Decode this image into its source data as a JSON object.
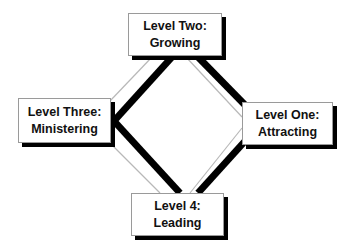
{
  "diagram": {
    "type": "cycle-diamond",
    "nodes": [
      {
        "id": "top",
        "line1": "Level Two:",
        "line2": "Growing"
      },
      {
        "id": "left",
        "line1": "Level Three:",
        "line2": "Ministering"
      },
      {
        "id": "right",
        "line1": "Level One:",
        "line2": "Attracting"
      },
      {
        "id": "bottom",
        "line1": "Level 4:",
        "line2": "Leading"
      }
    ],
    "colors": {
      "thick_line": "#000000",
      "thin_line": "#b8b8b8",
      "box_border": "#9a9a9a",
      "shadow": "#000000",
      "text": "#111111"
    }
  }
}
